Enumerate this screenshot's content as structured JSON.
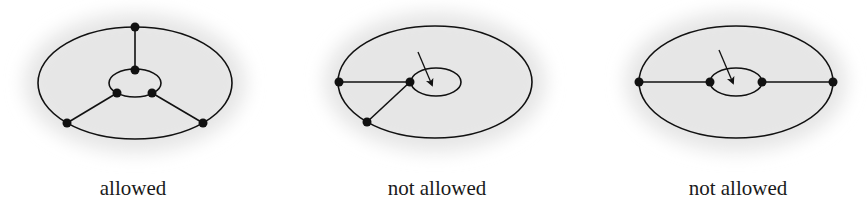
{
  "figure": {
    "panels": [
      {
        "id": "panel-1",
        "caption": "allowed",
        "outer_ellipse": {
          "cx": 135,
          "cy": 83,
          "rx": 97,
          "ry": 56
        },
        "inner_ellipse": {
          "cx": 135,
          "cy": 83,
          "rx": 26,
          "ry": 14
        },
        "vertices": [
          [
            135,
            27
          ],
          [
            135,
            70
          ],
          [
            117,
            93
          ],
          [
            152,
            93
          ],
          [
            67,
            123
          ],
          [
            203,
            123
          ]
        ],
        "edges": [
          [
            [
              135,
              27
            ],
            [
              135,
              70
            ]
          ],
          [
            [
              117,
              93
            ],
            [
              67,
              123
            ]
          ],
          [
            [
              152,
              93
            ],
            [
              203,
              123
            ]
          ]
        ],
        "arrow": null
      },
      {
        "id": "panel-2",
        "caption": "not allowed",
        "outer_ellipse": {
          "cx": 435,
          "cy": 82,
          "rx": 97,
          "ry": 56
        },
        "inner_ellipse": {
          "cx": 436,
          "cy": 82,
          "rx": 25,
          "ry": 14
        },
        "vertices": [
          [
            339,
            82
          ],
          [
            410,
            82
          ],
          [
            367,
            122
          ]
        ],
        "edges": [
          [
            [
              339,
              82
            ],
            [
              410,
              82
            ]
          ],
          [
            [
              410,
              82
            ],
            [
              367,
              122
            ]
          ]
        ],
        "arrow": {
          "from": [
            418,
            52
          ],
          "to": [
            432,
            85
          ]
        }
      },
      {
        "id": "panel-3",
        "caption": "not allowed",
        "outer_ellipse": {
          "cx": 736,
          "cy": 82,
          "rx": 97,
          "ry": 56
        },
        "inner_ellipse": {
          "cx": 736,
          "cy": 82,
          "rx": 26,
          "ry": 14
        },
        "vertices": [
          [
            639,
            82
          ],
          [
            710,
            82
          ],
          [
            762,
            82
          ],
          [
            833,
            82
          ]
        ],
        "edges": [
          [
            [
              639,
              82
            ],
            [
              710,
              82
            ]
          ],
          [
            [
              762,
              82
            ],
            [
              833,
              82
            ]
          ]
        ],
        "arrow": {
          "from": [
            719,
            50
          ],
          "to": [
            733,
            83
          ]
        }
      }
    ],
    "colors": {
      "stroke": "#111111",
      "shade": "#e6e6e6",
      "background": "#ffffff"
    }
  }
}
